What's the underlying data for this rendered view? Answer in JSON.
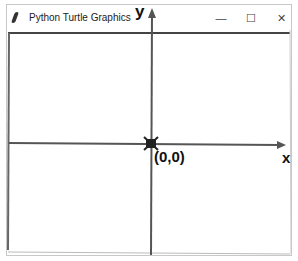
{
  "window": {
    "title": "Python Turtle Graphics",
    "controls": {
      "minimize": "—",
      "maximize": "☐",
      "close": "✕"
    }
  },
  "canvas": {
    "axis_color": "#555555",
    "labels": {
      "y": "y",
      "x": "x",
      "origin": "(0,0)"
    },
    "turtle_icon": "turtle-icon"
  }
}
